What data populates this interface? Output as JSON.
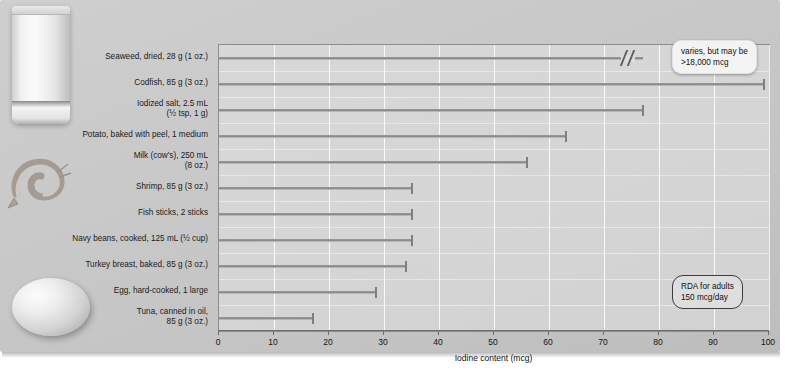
{
  "chart_data": {
    "type": "bar",
    "orientation": "horizontal",
    "title": "",
    "xlabel": "Iodine content (mcg)",
    "ylabel": "",
    "xlim": [
      0,
      100
    ],
    "xticks": [
      0,
      10,
      20,
      30,
      40,
      50,
      60,
      70,
      80,
      90,
      100
    ],
    "grid": true,
    "legend": false,
    "units": "mcg",
    "categories": [
      "Seaweed, dried, 28 g (1 oz.)",
      "Codfish, 85 g (3 oz.)",
      "Iodized salt, 2.5 mL\n(½ tsp, 1 g)",
      "Potato, baked with peel, 1 medium",
      "Milk (cow's), 250 mL\n(8 oz.)",
      "Shrimp, 85 g (3 oz.)",
      "Fish sticks, 2 sticks",
      "Navy beans, cooked, 125 mL (½ cup)",
      "Turkey breast, baked, 85 g (3 oz.)",
      "Egg, hard-cooked, 1 large",
      "Tuna, canned in oil,\n85 g (3 oz.)"
    ],
    "values": [
      77,
      99,
      77,
      63,
      56,
      35,
      35,
      35,
      34,
      28.5,
      17
    ],
    "broken_axis_bars": [
      0
    ],
    "annotations": [
      {
        "name": "seaweed-callout",
        "text": "varies, but may be\n>18,000 mcg",
        "attached_to": "Seaweed, dried, 28 g (1 oz.)"
      },
      {
        "name": "rda-callout",
        "text": "RDA for adults\n150 mcg/day"
      }
    ]
  },
  "axis": {
    "x_title": "Iodine content (mcg)",
    "tick_labels": [
      "0",
      "10",
      "20",
      "30",
      "40",
      "50",
      "60",
      "70",
      "80",
      "90",
      "100"
    ]
  },
  "callouts": {
    "seaweed": "varies, but may be\n>18,000 mcg",
    "rda": "RDA for adults\n150 mcg/day"
  },
  "photos": [
    {
      "name": "milk-glass-photo",
      "subject": "glass of milk"
    },
    {
      "name": "shrimp-photo",
      "subject": "shrimp"
    },
    {
      "name": "egg-photo",
      "subject": "hard-cooked egg"
    }
  ],
  "colors": {
    "panel": "#c7c7c7",
    "plot_fill": "#e2e2e2",
    "bar": "#8a8a8a",
    "axis": "#6e6e6e",
    "callout_seaweed_bg": "#f3f3f3",
    "callout_rda_bg": "#dedede",
    "text": "#111111"
  }
}
